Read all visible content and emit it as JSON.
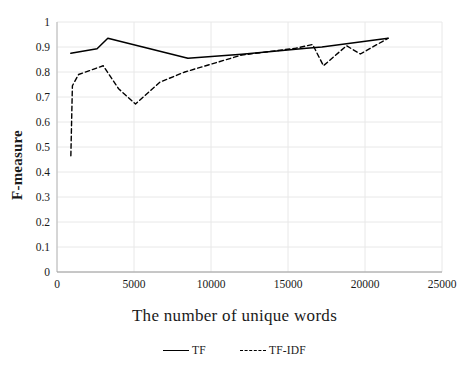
{
  "chart_data": {
    "type": "line",
    "title": "",
    "xlabel": "The number of unique words",
    "ylabel": "F-measure",
    "xlim": [
      0,
      25000
    ],
    "ylim": [
      0,
      1
    ],
    "xticks": [
      0,
      5000,
      10000,
      15000,
      20000,
      25000
    ],
    "xtick_labels": [
      "0",
      "5000",
      "10000",
      "15000",
      "20000",
      "25000"
    ],
    "yticks": [
      0,
      0.1,
      0.2,
      0.3,
      0.4,
      0.5,
      0.6,
      0.7,
      0.8,
      0.9,
      1
    ],
    "ytick_labels": [
      "0",
      "0.1",
      "0.2",
      "0.3",
      "0.4",
      "0.5",
      "0.6",
      "0.7",
      "0.8",
      "0.9",
      "1"
    ],
    "grid": true,
    "grid_color": "#e8e8e8",
    "legend_position": "bottom",
    "series": [
      {
        "name": "TF",
        "style": "solid",
        "color": "#000000",
        "points": [
          [
            900,
            0.875
          ],
          [
            2600,
            0.893
          ],
          [
            3300,
            0.935
          ],
          [
            8500,
            0.855
          ],
          [
            12000,
            0.871
          ],
          [
            16200,
            0.895
          ],
          [
            17200,
            0.9
          ],
          [
            21500,
            0.935
          ]
        ]
      },
      {
        "name": "TF-IDF",
        "style": "dashed",
        "color": "#000000",
        "points": [
          [
            900,
            0.465
          ],
          [
            1000,
            0.745
          ],
          [
            1400,
            0.79
          ],
          [
            3000,
            0.825
          ],
          [
            4000,
            0.733
          ],
          [
            5100,
            0.672
          ],
          [
            6700,
            0.76
          ],
          [
            8300,
            0.8
          ],
          [
            12000,
            0.868
          ],
          [
            15500,
            0.895
          ],
          [
            16600,
            0.91
          ],
          [
            17300,
            0.825
          ],
          [
            18800,
            0.905
          ],
          [
            19700,
            0.872
          ],
          [
            21500,
            0.935
          ]
        ]
      }
    ]
  },
  "legend": {
    "items": [
      {
        "label": "TF",
        "style": "solid"
      },
      {
        "label": "TF-IDF",
        "style": "dashed"
      }
    ]
  }
}
